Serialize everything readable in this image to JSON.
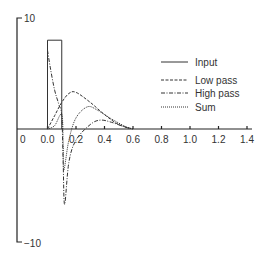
{
  "chart_data": {
    "type": "line",
    "title": "",
    "xlabel": "",
    "ylabel": "",
    "xlim": [
      0.0,
      1.4
    ],
    "ylim": [
      -10,
      10
    ],
    "grid": false,
    "legend_position": "upper right",
    "x_ticks": [
      "0.0",
      "0.2",
      "0.4",
      "0.6",
      "0.8",
      "1.0",
      "1.2",
      "1.4"
    ],
    "y_ticks": [
      "10",
      "-10"
    ],
    "origin_label": "0",
    "series": [
      {
        "name": "Input",
        "style": "solid",
        "x": [
          0.0,
          0.0,
          0.1,
          0.1
        ],
        "values": [
          0,
          8.0,
          8.0,
          0
        ]
      },
      {
        "name": "Low pass",
        "style": "dashed",
        "x": [
          0.0,
          0.05,
          0.1,
          0.15,
          0.2,
          0.3,
          0.4,
          0.5,
          0.6
        ],
        "values": [
          0,
          1.2,
          2.4,
          3.2,
          3.3,
          2.4,
          1.3,
          0.4,
          0.0
        ]
      },
      {
        "name": "High pass",
        "style": "dash-dot",
        "x": [
          0.0,
          0.02,
          0.05,
          0.08,
          0.1,
          0.11,
          0.12,
          0.15,
          0.2,
          0.3,
          0.37,
          0.45,
          0.55,
          0.6
        ],
        "values": [
          7.1,
          5.5,
          3.5,
          2.2,
          1.2,
          -3.0,
          -6.8,
          -3.0,
          -1.0,
          0.4,
          0.8,
          0.6,
          0.15,
          0.0
        ]
      },
      {
        "name": "Sum",
        "style": "dotted",
        "x": [
          0.0,
          0.05,
          0.1,
          0.11,
          0.115,
          0.15,
          0.2,
          0.28,
          0.35,
          0.45,
          0.55,
          0.6
        ],
        "values": [
          0,
          0.3,
          1.3,
          -1.5,
          -3.7,
          -1.0,
          1.0,
          2.0,
          1.7,
          0.9,
          0.2,
          0.0
        ]
      }
    ],
    "legend": [
      "Input",
      "Low pass",
      "High pass",
      "Sum"
    ]
  },
  "axis": {
    "y_top_label": "10",
    "y_bottom_label": "−10",
    "origin_label": "0",
    "x_tick_labels": [
      "0.0",
      "0.2",
      "0.4",
      "0.6",
      "0.8",
      "1.0",
      "1.2",
      "1.4"
    ]
  },
  "legend": {
    "items": [
      {
        "label": "Input",
        "dash": ""
      },
      {
        "label": "Low pass",
        "dash": "3,1.5"
      },
      {
        "label": "High pass",
        "dash": "4,1.5,1,1.5"
      },
      {
        "label": "Sum",
        "dash": "1,1"
      }
    ]
  },
  "colors": {
    "line": "#333333",
    "background": "#ffffff"
  }
}
